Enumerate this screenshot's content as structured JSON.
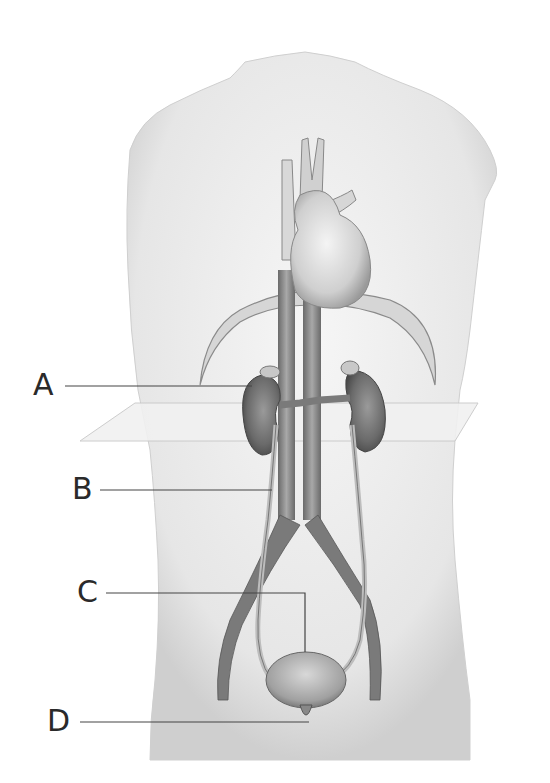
{
  "diagram": {
    "labels": [
      {
        "id": "A",
        "text": "A",
        "points_to": "left kidney"
      },
      {
        "id": "B",
        "text": "B",
        "points_to": "left ureter"
      },
      {
        "id": "C",
        "text": "C",
        "points_to": "urinary bladder"
      },
      {
        "id": "D",
        "text": "D",
        "points_to": "urethra"
      }
    ],
    "structures": [
      "torso outline",
      "heart",
      "aorta",
      "inferior vena cava",
      "diaphragm",
      "kidneys",
      "renal vessels",
      "ureters",
      "iliac vessels",
      "bladder",
      "transverse plane"
    ]
  },
  "colors": {
    "background": "#ffffff",
    "skin": "#e8e8e8",
    "organ_dark": "#6a6a6a",
    "vessel": "#8a8a8a",
    "leader_line": "#444444"
  }
}
